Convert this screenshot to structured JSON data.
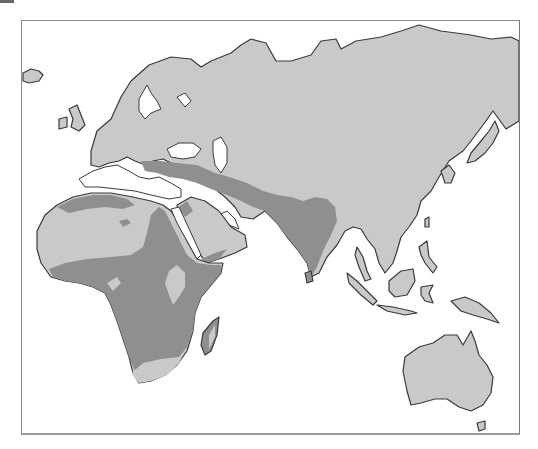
{
  "map": {
    "type": "species range map",
    "region": "Africa, Europe, Asia, Australia",
    "style": "grayscale",
    "colors": {
      "background": "#ffffff",
      "land": "#c9c9c9",
      "range": "#8f8f8f",
      "coastline": "#3a3a3a",
      "frame": "#8a8a8a"
    },
    "legend": [
      {
        "label": "",
        "color": "#8f8f8f"
      }
    ],
    "shaded_regions": [
      "Sub-Saharan Africa (excluding Ethiopian highlands and southern tip)",
      "Northwest Africa coastal band",
      "Sinai, Egypt and Nile corridor",
      "Anatolia and Caucasus band",
      "Southern Arabian coast and Levant strip",
      "Iran, Afghanistan and Pakistan belt",
      "Indian subcontinent and Sri Lanka",
      "Western Madagascar"
    ]
  }
}
